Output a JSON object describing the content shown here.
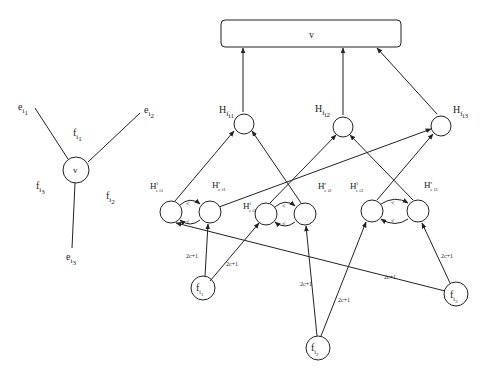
{
  "left_graph": {
    "center_vertex": "v",
    "edges": [
      {
        "label": "e",
        "sub": "i1"
      },
      {
        "label": "e",
        "sub": "i2"
      },
      {
        "label": "e",
        "sub": "i3"
      }
    ],
    "faces": [
      {
        "label": "f",
        "sub": "i1"
      },
      {
        "label": "f",
        "sub": "i2"
      },
      {
        "label": "f",
        "sub": "i3"
      }
    ]
  },
  "gadget": {
    "top_box": "v",
    "face_hubs": [
      {
        "label": "H",
        "sub": "f i1"
      },
      {
        "label": "H",
        "sub": "f i2"
      },
      {
        "label": "H",
        "sub": "f i3"
      }
    ],
    "edge_pairs": [
      {
        "left": {
          "label": "H",
          "sup": "l",
          "sub": "e i1"
        },
        "right": {
          "label": "H",
          "sup": "r",
          "sub": "e i1"
        },
        "arrow_labels": [
          "<",
          "<"
        ]
      },
      {
        "left": {
          "label": "H",
          "sup": "l",
          "sub": "e i2"
        },
        "right": {
          "label": "H",
          "sup": "r",
          "sub": "e i2"
        },
        "arrow_labels": [
          "<",
          "<"
        ]
      },
      {
        "left": {
          "label": "H",
          "sup": "l",
          "sub": "e i3"
        },
        "right": {
          "label": "H",
          "sup": "r",
          "sub": "e i3"
        },
        "arrow_labels": [
          "<",
          "<"
        ]
      }
    ],
    "face_sources": [
      {
        "label": "f",
        "sub": "i1"
      },
      {
        "label": "f",
        "sub": "i2"
      },
      {
        "label": "f",
        "sub": "i3"
      }
    ],
    "weight_label": "2c+1"
  }
}
